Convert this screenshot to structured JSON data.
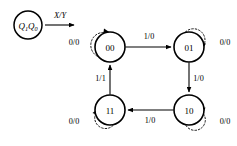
{
  "diagram": {
    "type": "mealy-state-transition-diagram",
    "title": "",
    "canvas": {
      "width": 237,
      "height": 146,
      "background": "#ffffff"
    },
    "ink_color": "#000000",
    "legend": {
      "state_var_main": "Q",
      "state_var_label": "Q₁Q₀",
      "state_var_part1": "Q",
      "state_var_sub1": "1",
      "state_var_part2": "Q",
      "state_var_sub2": "0",
      "arrow_label": "X/Y",
      "circle": {
        "cx": 28,
        "cy": 25,
        "r": 14
      },
      "arrow": {
        "x1": 45,
        "y1": 25,
        "x2": 76,
        "y2": 25
      },
      "arrow_label_pos": {
        "x": 60,
        "y": 15
      }
    },
    "states": [
      {
        "id": "s00",
        "label": "00",
        "cx": 110,
        "cy": 47,
        "r": 15
      },
      {
        "id": "s01",
        "label": "01",
        "cx": 189,
        "cy": 47,
        "r": 15
      },
      {
        "id": "s11",
        "label": "11",
        "cx": 110,
        "cy": 110,
        "r": 15
      },
      {
        "id": "s10",
        "label": "10",
        "cx": 189,
        "cy": 110,
        "r": 15
      }
    ],
    "transitions": [
      {
        "id": "t-00-01",
        "from": "s00",
        "to": "s01",
        "label": "1/0",
        "style": "solid",
        "label_pos": {
          "x": 149,
          "y": 37
        },
        "path": "M 125.5 47 L 172 47"
      },
      {
        "id": "t-01-10",
        "from": "s01",
        "to": "s10",
        "label": "1/0",
        "style": "solid",
        "label_pos": {
          "x": 198,
          "y": 78
        },
        "path": "M 189 62.5 L 189 93"
      },
      {
        "id": "t-10-11",
        "from": "s10",
        "to": "s11",
        "label": "1/0",
        "style": "solid",
        "label_pos": {
          "x": 150,
          "y": 120
        },
        "path": "M 173.5 110 L 127 110"
      },
      {
        "id": "t-11-00",
        "from": "s11",
        "to": "s00",
        "label": "1/1",
        "style": "solid",
        "label_pos": {
          "x": 101,
          "y": 78
        },
        "path": "M 110 94.5 L 110 64"
      }
    ],
    "self_loops": [
      {
        "id": "loop-00",
        "state": "s00",
        "label": "0/0",
        "style": "dotted",
        "position": "top-left",
        "label_pos": {
          "x": 74,
          "y": 42
        },
        "path": "M 98.5 36.5 A 9.5 9.5 0 1 1 109 32",
        "arrow": {
          "x": 110,
          "y": 32,
          "angle": 105
        }
      },
      {
        "id": "loop-01",
        "state": "s01",
        "label": "0/0",
        "style": "dotted",
        "position": "top-right",
        "label_pos": {
          "x": 225,
          "y": 42
        },
        "path": "M 189 32 A 9.5 9.5 0 1 1 200.5 37.5",
        "arrow": {
          "x": 201.5,
          "y": 39,
          "angle": 160
        }
      },
      {
        "id": "loop-11",
        "state": "s11",
        "label": "0/0",
        "style": "dotted",
        "position": "bottom-left",
        "label_pos": {
          "x": 74,
          "y": 121
        },
        "path": "M 110 125 A 9.5 9.5 0 1 1 97.5 118",
        "arrow": {
          "x": 96,
          "y": 117,
          "angle": -20
        }
      },
      {
        "id": "loop-10",
        "state": "s10",
        "label": "0/0",
        "style": "dotted",
        "position": "bottom-right",
        "label_pos": {
          "x": 225,
          "y": 121
        },
        "path": "M 189 125.5 A 9.5 9.5 0 1 0 201 118",
        "arrow": {
          "x": 202,
          "y": 117,
          "angle": 200
        }
      }
    ]
  }
}
